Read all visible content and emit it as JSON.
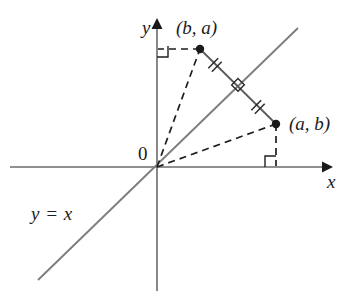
{
  "figure": {
    "kind": "coordinate-plane-diagram",
    "background_color": "#ffffff"
  },
  "axes": {
    "x_label": "x",
    "y_label": "y",
    "origin_label": "0",
    "axis_color": "#6b6b6b",
    "origin": {
      "x": 157,
      "y": 167
    },
    "x_axis": {
      "x1": 10,
      "y1": 167,
      "x2": 332,
      "y2": 167
    },
    "y_axis": {
      "x1": 157,
      "y1": 290,
      "x2": 157,
      "y2": 20
    }
  },
  "line": {
    "label": "y = x",
    "color": "#7d7d7d",
    "from": {
      "x": 38,
      "y": 280
    },
    "to": {
      "x": 298,
      "y": 28
    }
  },
  "points": [
    {
      "label": "(b, a)",
      "dot_color": "#1a1a1a",
      "position": {
        "x": 200,
        "y": 49
      }
    },
    {
      "label": "(a, b)",
      "dot_color": "#1a1a1a",
      "position": {
        "x": 276,
        "y": 124
      }
    }
  ],
  "segment": {
    "name": "segment-between-points",
    "color": "#5a5a5a",
    "from": {
      "x": 200,
      "y": 49
    },
    "to": {
      "x": 276,
      "y": 124
    },
    "tick_marks": [
      {
        "x": 215,
        "y": 65
      },
      {
        "x": 258,
        "y": 107
      }
    ],
    "perpendicular_marker": {
      "x": 238,
      "y": 87
    }
  },
  "dashed_lines": [
    {
      "name": "origin-to-point-ba",
      "from": {
        "x": 157,
        "y": 167
      },
      "to": {
        "x": 200,
        "y": 49
      }
    },
    {
      "name": "origin-to-point-ab",
      "from": {
        "x": 157,
        "y": 167
      },
      "to": {
        "x": 276,
        "y": 124
      }
    },
    {
      "name": "point-ba-to-y-axis",
      "from": {
        "x": 200,
        "y": 49
      },
      "to": {
        "x": 157,
        "y": 49
      }
    },
    {
      "name": "point-ab-to-x-axis",
      "from": {
        "x": 276,
        "y": 124
      },
      "to": {
        "x": 276,
        "y": 167
      }
    }
  ],
  "right_angle_markers": [
    {
      "name": "right-angle-at-y-axis",
      "x": 157,
      "y": 46,
      "size": 11
    },
    {
      "name": "right-angle-at-x-axis",
      "x": 265,
      "y": 156,
      "size": 11
    }
  ],
  "colors": {
    "ink": "#1c1c1c",
    "axis": "#6b6b6b",
    "line": "#7d7d7d",
    "segment": "#5a5a5a",
    "dash": "#1f1f1f"
  }
}
